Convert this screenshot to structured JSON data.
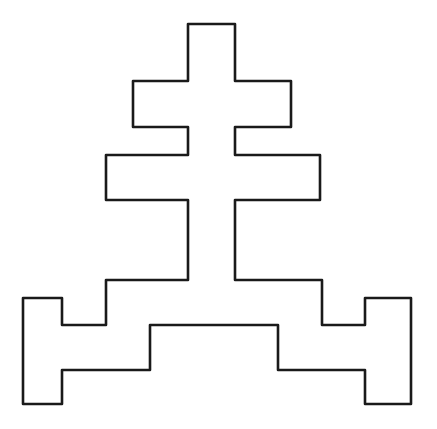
{
  "figure": {
    "description": "Rectilinear outline symbol: stepped cross with two crossbars on a stepped base with two feet",
    "stroke_color": "#1a1a1a",
    "background": "#ffffff",
    "stroke_width": 2.6,
    "outline_points": [
      [
        188,
        24
      ],
      [
        235,
        24
      ],
      [
        235,
        81
      ],
      [
        291,
        81
      ],
      [
        291,
        127
      ],
      [
        235,
        127
      ],
      [
        235,
        155
      ],
      [
        320,
        155
      ],
      [
        320,
        200
      ],
      [
        235,
        200
      ],
      [
        235,
        280
      ],
      [
        322,
        280
      ],
      [
        322,
        325
      ],
      [
        365,
        325
      ],
      [
        365,
        298
      ],
      [
        411,
        298
      ],
      [
        411,
        404
      ],
      [
        365,
        404
      ],
      [
        365,
        370
      ],
      [
        278,
        370
      ],
      [
        278,
        325
      ],
      [
        150,
        325
      ],
      [
        150,
        370
      ],
      [
        62,
        370
      ],
      [
        62,
        404
      ],
      [
        23,
        404
      ],
      [
        23,
        298
      ],
      [
        62,
        298
      ],
      [
        62,
        325
      ],
      [
        106,
        325
      ],
      [
        106,
        280
      ],
      [
        188,
        280
      ],
      [
        188,
        200
      ],
      [
        106,
        200
      ],
      [
        106,
        155
      ],
      [
        188,
        155
      ],
      [
        188,
        127
      ],
      [
        133,
        127
      ],
      [
        133,
        81
      ],
      [
        188,
        81
      ]
    ]
  }
}
